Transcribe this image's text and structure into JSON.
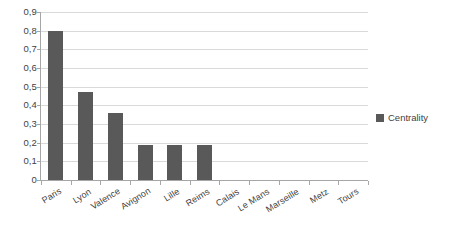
{
  "chart_data": {
    "type": "bar",
    "title": "",
    "xlabel": "",
    "ylabel": "",
    "categories": [
      "Paris",
      "Lyon",
      "Valence",
      "Avignon",
      "Lille",
      "Reims",
      "Calais",
      "Le Mans",
      "Marseille",
      "Metz",
      "Tours"
    ],
    "series": [
      {
        "name": "Centrality",
        "color": "#595959",
        "values": [
          0.8,
          0.47,
          0.36,
          0.19,
          0.19,
          0.19,
          0,
          0,
          0,
          0,
          0
        ]
      }
    ],
    "ylim": [
      0,
      0.9
    ],
    "ytick_values": [
      0,
      0.1,
      0.2,
      0.3,
      0.4,
      0.5,
      0.6,
      0.7,
      0.8,
      0.9
    ],
    "ytick_labels": [
      "0",
      "0,1",
      "0,2",
      "0,3",
      "0,4",
      "0,5",
      "0,6",
      "0,7",
      "0,8",
      "0,9"
    ],
    "grid": true,
    "grid_color": "#d9d9d9",
    "axis_color": "#a6a6a6",
    "legend": {
      "position": "right",
      "entries": [
        {
          "label": "Centrality",
          "color": "#595959",
          "marker": "square"
        }
      ]
    },
    "decimal_separator": ",",
    "background": "#ffffff",
    "text_color": "#3f3f3f"
  }
}
